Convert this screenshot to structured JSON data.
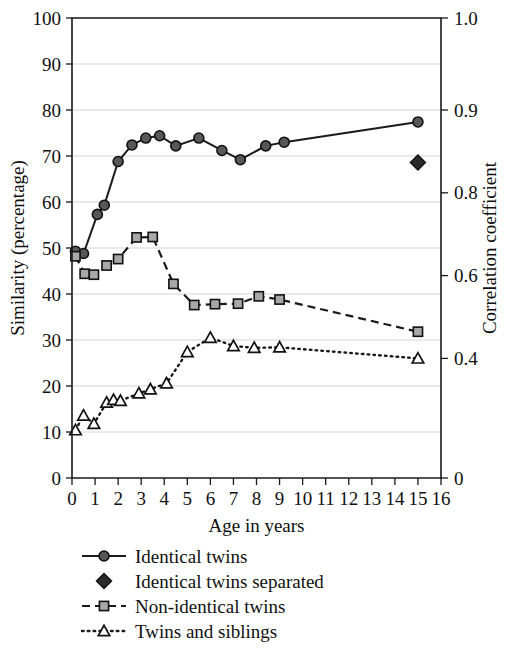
{
  "chart_data": {
    "type": "line",
    "title": "",
    "xlabel": "Age in years",
    "ylabel": "Similarity (percentage)",
    "y2label": "Correlation coefficient",
    "xlim": [
      0,
      16
    ],
    "ylim": [
      0,
      100
    ],
    "grid": true,
    "legend_position": "below",
    "xticks": [
      0,
      1,
      2,
      3,
      4,
      5,
      6,
      7,
      8,
      9,
      10,
      11,
      12,
      13,
      14,
      15,
      16
    ],
    "xticklabels": [
      "0",
      "1",
      "2",
      "3",
      "4",
      "5",
      "6",
      "7",
      "8",
      "9",
      "10",
      "11",
      "12",
      "13",
      "14",
      "15",
      "16"
    ],
    "yticks": [
      0,
      10,
      20,
      30,
      40,
      50,
      60,
      70,
      80,
      90,
      100
    ],
    "yticklabels": [
      "0",
      "10",
      "20",
      "30",
      "40",
      "50",
      "60",
      "70",
      "80",
      "90",
      "100"
    ],
    "y2ticklabels": [
      "0",
      "0.4",
      "0.6",
      "0.8",
      "0.9",
      "1.0"
    ],
    "y2tickvalues": [
      0,
      26,
      44,
      62,
      80,
      100
    ],
    "series": [
      {
        "name": "Identical twins",
        "marker": "circle",
        "linestyle": "solid",
        "x": [
          0.15,
          0.5,
          1.1,
          1.4,
          2.0,
          2.6,
          3.2,
          3.8,
          4.5,
          5.5,
          6.5,
          7.3,
          8.4,
          9.2,
          15.0
        ],
        "y": [
          49.3,
          48.8,
          57.3,
          59.3,
          68.8,
          72.4,
          73.9,
          74.4,
          72.2,
          73.9,
          71.2,
          69.2,
          72.2,
          73.0,
          77.4
        ]
      },
      {
        "name": "Identical twins separated",
        "marker": "diamond",
        "linestyle": "none",
        "x": [
          15.0
        ],
        "y": [
          68.6
        ]
      },
      {
        "name": "Non-identical twins",
        "marker": "square",
        "linestyle": "dashed",
        "x": [
          0.15,
          0.55,
          0.95,
          1.5,
          2.0,
          2.8,
          3.5,
          4.4,
          5.3,
          6.2,
          7.2,
          8.1,
          9.0,
          15.0
        ],
        "y": [
          48.2,
          44.4,
          44.2,
          46.2,
          47.6,
          52.3,
          52.4,
          42.2,
          37.6,
          37.8,
          37.9,
          39.5,
          38.8,
          31.8
        ]
      },
      {
        "name": "Twins and siblings",
        "marker": "triangle",
        "linestyle": "dotted",
        "x": [
          0.15,
          0.5,
          0.95,
          1.5,
          1.8,
          2.1,
          2.9,
          3.4,
          4.1,
          5.0,
          6.0,
          7.0,
          7.9,
          9.0,
          15.0
        ],
        "y": [
          10.4,
          13.6,
          11.8,
          16.4,
          17.0,
          16.8,
          18.4,
          19.3,
          20.6,
          27.4,
          30.5,
          28.7,
          28.3,
          28.4,
          26.0
        ]
      }
    ],
    "legend": [
      {
        "label": "Identical twins",
        "marker": "circle",
        "linestyle": "solid"
      },
      {
        "label": "Identical twins separated",
        "marker": "diamond",
        "linestyle": "none"
      },
      {
        "label": "Non-identical twins",
        "marker": "square",
        "linestyle": "dashed"
      },
      {
        "label": "Twins and siblings",
        "marker": "triangle",
        "linestyle": "dotted"
      }
    ]
  },
  "colors": {
    "axis": "#1a1a1a",
    "grid": "#c9c9c9",
    "marker_fill_circle": "#585858",
    "marker_fill_square": "#a8a8a8",
    "marker_fill_triangle": "#ffffff",
    "marker_fill_diamond": "#2a2a2a"
  }
}
